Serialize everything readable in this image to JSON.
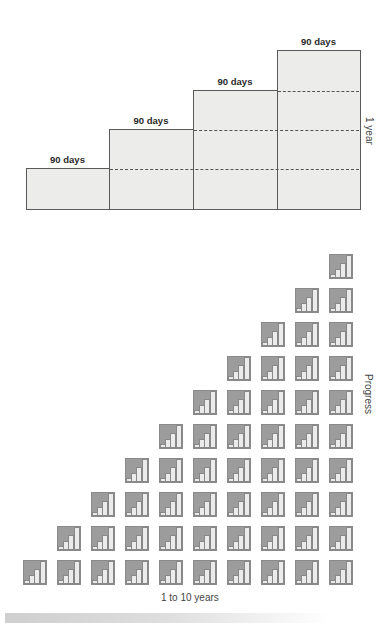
{
  "top_diagram": {
    "steps": [
      {
        "label": "90 days",
        "left": 26,
        "top": 168,
        "right": 109
      },
      {
        "label": "90 days",
        "left": 109,
        "top": 129,
        "right": 193
      },
      {
        "label": "90 days",
        "left": 193,
        "top": 90,
        "right": 277
      },
      {
        "label": "90 days",
        "left": 277,
        "top": 50,
        "right": 360
      }
    ],
    "bottom": 209,
    "side_label": "1 year"
  },
  "bottom_diagram": {
    "columns": 10,
    "y_label": "Progress",
    "x_label": "1 to 10 years"
  },
  "colors": {
    "box_fill": "#ececea",
    "box_border": "#5a5a5a",
    "tile_dark": "#9c9c9c",
    "tile_bar": "#ebebeb"
  }
}
